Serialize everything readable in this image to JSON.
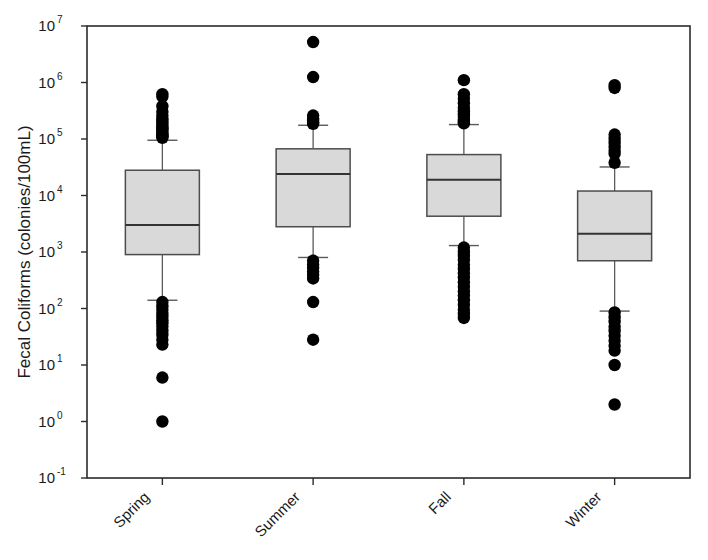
{
  "chart_data": {
    "type": "box",
    "title": "",
    "xlabel": "",
    "ylabel": "Fecal Coliforms (colonies/100mL)",
    "categories": [
      "Spring",
      "Summer",
      "Fall",
      "Winter"
    ],
    "yscale": "log",
    "ylim": [
      0.1,
      10000000
    ],
    "ytick_values": [
      0.1,
      1,
      10,
      100,
      1000,
      10000,
      100000,
      1000000,
      10000000
    ],
    "ytick_labels": [
      "10-1",
      "100",
      "101",
      "102",
      "103",
      "104",
      "105",
      "106",
      "107"
    ],
    "ytick_mantissa": "10",
    "ytick_exponents": [
      "-1",
      "0",
      "1",
      "2",
      "3",
      "4",
      "5",
      "6",
      "7"
    ],
    "grid": false,
    "legend": null,
    "box_fill_color": "#d9d9d9",
    "box_edge_color": "#4d4d4d",
    "marker_color": "#000000",
    "frame_color": "#2b2b2b",
    "boxes": [
      {
        "category": "Spring",
        "whisker_high": 95000,
        "q3": 28000,
        "median": 3000,
        "q1": 900,
        "whisker_low": 140,
        "outliers_high": [
          620000,
          560000,
          380000,
          300000,
          260000,
          230000,
          210000,
          195000,
          180000,
          165000,
          155000,
          145000,
          135000,
          125000,
          120000,
          115000,
          110000,
          105000
        ],
        "outliers_low": [
          130,
          110,
          95,
          80,
          72,
          62,
          55,
          48,
          40,
          34,
          28,
          23,
          6,
          1
        ]
      },
      {
        "category": "Summer",
        "whisker_high": 175000,
        "q3": 67000,
        "median": 24000,
        "q1": 2800,
        "whisker_low": 800,
        "outliers_high": [
          5200000,
          1250000,
          260000,
          230000,
          210000,
          195000,
          185000
        ],
        "outliers_low": [
          700,
          600,
          520,
          450,
          390,
          340,
          130,
          28
        ]
      },
      {
        "category": "Fall",
        "whisker_high": 180000,
        "q3": 53000,
        "median": 19000,
        "q1": 4300,
        "whisker_low": 1300,
        "outliers_high": [
          1100000,
          620000,
          520000,
          430000,
          360000,
          310000,
          275000,
          245000,
          220000,
          200000,
          190000
        ],
        "outliers_low": [
          1200,
          1000,
          850,
          720,
          600,
          500,
          420,
          350,
          290,
          240,
          200,
          170,
          140,
          115,
          95,
          80,
          68
        ]
      },
      {
        "category": "Winter",
        "whisker_high": 32000,
        "q3": 12000,
        "median": 2100,
        "q1": 700,
        "whisker_low": 90,
        "outliers_high": [
          900000,
          800000,
          120000,
          100000,
          85000,
          72000,
          62000,
          55000,
          38000
        ],
        "outliers_low": [
          85,
          70,
          58,
          48,
          40,
          33,
          27,
          22,
          18,
          10,
          2
        ]
      }
    ]
  },
  "axis": {
    "y_label": "Fecal Coliforms (colonies/100mL)"
  }
}
